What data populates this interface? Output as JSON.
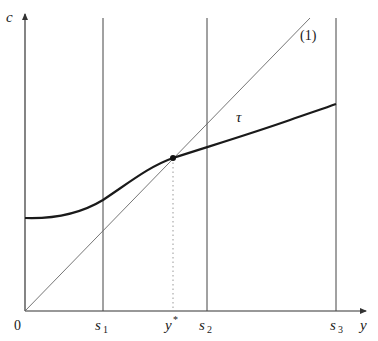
{
  "figure": {
    "axes": {
      "y_axis_label": "c",
      "x_axis_label": "y",
      "origin_label": "0"
    },
    "vertical_markers": [
      {
        "id": "s1",
        "label_base": "s",
        "label_sub": "1",
        "x": 103
      },
      {
        "id": "s2",
        "label_base": "s",
        "label_sub": "2",
        "x": 207
      },
      {
        "id": "s3",
        "label_base": "s",
        "label_sub": "3",
        "x": 336
      }
    ],
    "equilibrium": {
      "label_base": "y",
      "label_sup": "*",
      "x": 173,
      "y": 158
    },
    "line_label": "(1)",
    "curve_label": "τ",
    "colors": {
      "axis": "#333333",
      "curve": "#1a1a1a",
      "diagonal": "#555555",
      "dotted": "#999999"
    }
  }
}
